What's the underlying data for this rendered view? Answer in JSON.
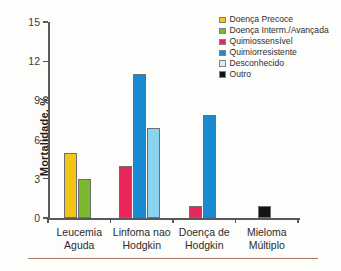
{
  "chart_data": {
    "type": "bar",
    "title": "",
    "xlabel": "",
    "ylabel": "Mortalidade, %",
    "ylim": [
      0,
      15
    ],
    "yticks": [
      0,
      3,
      6,
      9,
      12,
      15
    ],
    "grid": false,
    "legend_position": "top-right",
    "categories": [
      "Leucemia\nAguda",
      "Linfoma nao\nHodgkin",
      "Doença de\nHodgkin",
      "Mieloma\nMúltiplo"
    ],
    "category_lines": [
      [
        "Leucemia",
        "Aguda"
      ],
      [
        "Linfoma nao",
        "Hodgkin"
      ],
      [
        "Doença de",
        "Hodgkin"
      ],
      [
        "Mieloma",
        "Múltiplo"
      ]
    ],
    "series": [
      {
        "name": "Doença Precoce",
        "color": "#f3c516",
        "values": [
          5.0,
          null,
          null,
          null
        ]
      },
      {
        "name": "Doença Interm./Avançada",
        "color": "#7cb82f",
        "values": [
          3.0,
          null,
          null,
          null
        ]
      },
      {
        "name": "Quimiossensível",
        "color": "#e8265a",
        "values": [
          null,
          4.0,
          0.9,
          null
        ]
      },
      {
        "name": "Quimiorresistente",
        "color": "#1a8bd3",
        "values": [
          null,
          11.0,
          7.9,
          null
        ]
      },
      {
        "name": "Desconhecido",
        "color": "#8bd4ef",
        "values": [
          null,
          6.9,
          null,
          null
        ]
      },
      {
        "name": "Outro",
        "color": "#141414",
        "values": [
          null,
          null,
          null,
          0.9
        ]
      }
    ]
  },
  "legend": {
    "items": [
      {
        "label": "Doença Precoce",
        "color": "#f3c516"
      },
      {
        "label": "Doença Interm./Avançada",
        "color": "#7cb82f"
      },
      {
        "label": "Quimiossensível",
        "color": "#e8265a"
      },
      {
        "label": "Quimiorresistente",
        "color": "#1a8bd3"
      },
      {
        "label": "Desconhecido",
        "color": "#d8eefa"
      },
      {
        "label": "Outro",
        "color": "#141414"
      }
    ]
  },
  "axis": {
    "y_label": "Mortalidade, %",
    "y_ticks": [
      "0",
      "3",
      "6",
      "9",
      "12",
      "15"
    ]
  }
}
